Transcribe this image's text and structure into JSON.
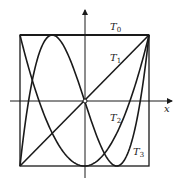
{
  "diagram": {
    "axis_label_x": "x",
    "curves": [
      {
        "name": "T",
        "sub": "0",
        "formula": "1"
      },
      {
        "name": "T",
        "sub": "1",
        "formula": "x"
      },
      {
        "name": "T",
        "sub": "2",
        "formula": "2x^2-1"
      },
      {
        "name": "T",
        "sub": "3",
        "formula": "4x^3-3x"
      }
    ],
    "domain": [
      -1,
      1
    ],
    "range": [
      -1,
      1
    ],
    "colors": {
      "stroke": "#1a1a1a",
      "background": "#ffffff"
    }
  }
}
